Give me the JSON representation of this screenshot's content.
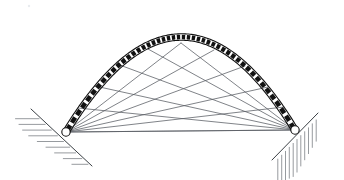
{
  "figure": {
    "background_color": "#ffffff",
    "width": 344,
    "height": 180
  },
  "colors": {
    "arch_outline": "#111111",
    "voussoir_fill": "#111111",
    "cable": "#555a60",
    "support_face": "#3a3f44",
    "hatch": "#6a7076",
    "pin_fill": "#ffffff"
  },
  "arch": {
    "label": "segmented arch ring",
    "span_start": {
      "x": 66,
      "y": 132
    },
    "span_end": {
      "x": 295,
      "y": 130
    },
    "crown": {
      "x": 181,
      "y": 37
    },
    "rise": 95,
    "span": 229,
    "ring_thickness": 6.5,
    "voussoir_count": 46,
    "voussoir_gap": 0.34
  },
  "supports": [
    {
      "name": "left-abutment",
      "side": "left",
      "pin": {
        "x": 66,
        "y": 132
      },
      "face_from": {
        "x": 31,
        "y": 109
      },
      "face_to": {
        "x": 92,
        "y": 166
      },
      "hatch_orientation": "horizontal",
      "hatch_count": 9
    },
    {
      "name": "right-abutment",
      "side": "right",
      "pin": {
        "x": 295,
        "y": 130
      },
      "face_from": {
        "x": 272,
        "y": 160
      },
      "face_to": {
        "x": 318,
        "y": 113
      },
      "hatch_orientation": "vertical",
      "hatch_count": 11
    }
  ],
  "cables": {
    "label": "radiating tie members",
    "left_fan_count": 6,
    "right_fan_count": 6,
    "left_anchor": {
      "x": 66,
      "y": 132
    },
    "right_anchor": {
      "x": 295,
      "y": 130
    },
    "left_targets": [
      {
        "x": 181,
        "y": 43
      },
      {
        "x": 214,
        "y": 50
      },
      {
        "x": 245,
        "y": 66
      },
      {
        "x": 268,
        "y": 87
      },
      {
        "x": 284,
        "y": 107
      },
      {
        "x": 295,
        "y": 130
      }
    ],
    "right_targets": [
      {
        "x": 181,
        "y": 43
      },
      {
        "x": 148,
        "y": 49
      },
      {
        "x": 117,
        "y": 64
      },
      {
        "x": 95,
        "y": 86
      },
      {
        "x": 78,
        "y": 108
      },
      {
        "x": 66,
        "y": 132
      }
    ]
  },
  "speck": {
    "x": 29,
    "y": 6,
    "r": 1.2
  }
}
